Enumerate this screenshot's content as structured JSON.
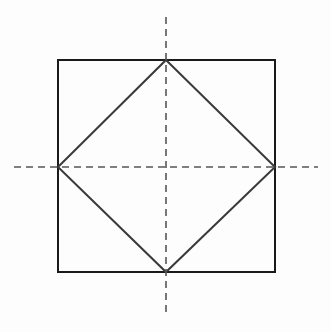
{
  "figure": {
    "canvas": {
      "width": 331,
      "height": 332,
      "background_color": "#fdfdfd"
    },
    "colors": {
      "outer_square_stroke": "#1a1a1a",
      "inscribed_square_stroke": "#3a3a3a",
      "centerline_stroke": "#555555",
      "background": "#fdfdfd"
    },
    "strokes": {
      "outer_square_width": 2,
      "inscribed_square_width": 2,
      "centerline_width": 1.6,
      "centerline_dash": "7 5"
    },
    "outer_square": {
      "name": "outer-square",
      "left": 58,
      "top": 60,
      "right": 275,
      "bottom": 272,
      "width": 217,
      "height": 212,
      "corners": [
        {
          "label": "top-left",
          "x": 58,
          "y": 60
        },
        {
          "label": "top-right",
          "x": 275,
          "y": 60
        },
        {
          "label": "bottom-right",
          "x": 275,
          "y": 272
        },
        {
          "label": "bottom-left",
          "x": 58,
          "y": 272
        }
      ]
    },
    "inscribed_square": {
      "name": "inscribed-rotated-square",
      "description": "Square rotated 45 degrees, vertices at the midpoints of the outer square edges",
      "vertices": [
        {
          "label": "top",
          "x": 166,
          "y": 60
        },
        {
          "label": "right",
          "x": 275,
          "y": 167
        },
        {
          "label": "bottom",
          "x": 166,
          "y": 272
        },
        {
          "label": "left",
          "x": 58,
          "y": 167
        }
      ],
      "points_attr": "166,60 275,167 166,272 58,167"
    },
    "centerlines": {
      "center": {
        "x": 166,
        "y": 167
      },
      "vertical": {
        "name": "vertical-centerline",
        "x": 166,
        "y_start": 17,
        "y_end": 315
      },
      "horizontal": {
        "name": "horizontal-centerline",
        "y": 167,
        "x_start": 14,
        "x_end": 318
      }
    }
  }
}
